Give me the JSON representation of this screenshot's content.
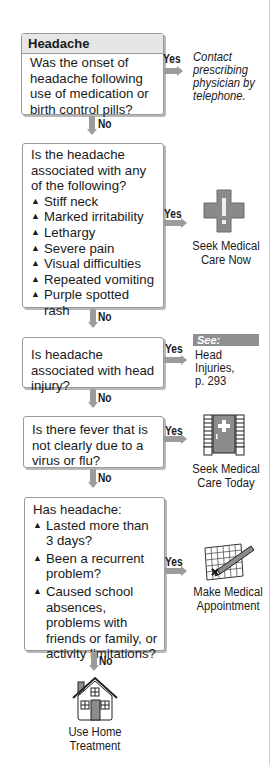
{
  "flowchart": {
    "title": "Headache",
    "colors": {
      "arrow": "#9c9c9c",
      "box_border": "#9a9a9a",
      "header_bg": "#e6e6e6",
      "see_bg": "#8f8f8f"
    },
    "yes_label": "Yes",
    "no_label": "No",
    "steps": [
      {
        "question": "Was the onset of headache following use of medication or birth control pills?",
        "yes_outcome": "Contact prescribing physician by telephone."
      },
      {
        "question": "Is the headache associated with any of the following?",
        "items": [
          "Stiff neck",
          "Marked irritability",
          "Lethargy",
          "Severe pain",
          "Visual difficulties",
          "Repeated vomiting",
          "Purple spotted rash"
        ],
        "yes_outcome": "Seek Medical Care Now",
        "yes_icon": "medical-cross-icon"
      },
      {
        "question": "Is headache associated with head injury?",
        "see_label": "See:",
        "yes_outcome": "Head Injuries, p. 293"
      },
      {
        "question": "Is there fever that is not clearly due to a virus or flu?",
        "yes_outcome": "Seek Medical Care Today",
        "yes_icon": "clinic-door-icon"
      },
      {
        "question": "Has headache:",
        "items": [
          "Lasted more than 3 days?",
          "Been a recurrent problem?",
          "Caused school absences, problems with friends or family, or activity limitations?"
        ],
        "yes_outcome": "Make Medical Appointment",
        "yes_icon": "calendar-pencil-icon"
      }
    ],
    "final_outcome": "Use Home Treatment",
    "final_icon": "house-icon",
    "bullet_glyph": "▲"
  }
}
